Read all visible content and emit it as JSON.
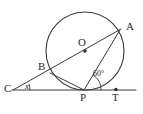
{
  "figure": {
    "type": "circle-geometry-diagram",
    "background_color": "#ffffff",
    "stroke_color": "#3a3a3a",
    "label_color": "#2b2b2b",
    "circle": {
      "center_label": "O",
      "center_x": 85,
      "center_y": 51,
      "radius": 39
    },
    "points": [
      {
        "id": "A",
        "label": "A",
        "x": 120,
        "y": 30,
        "label_x": 126,
        "label_y": 21,
        "on_circle": true,
        "has_dot": false
      },
      {
        "id": "B",
        "label": "B",
        "x": 50,
        "y": 73,
        "label_x": 38,
        "label_y": 61,
        "on_circle": true,
        "has_dot": false
      },
      {
        "id": "C",
        "label": "C",
        "x": 13,
        "y": 90,
        "label_x": 4,
        "label_y": 83,
        "on_circle": false,
        "has_dot": false
      },
      {
        "id": "O",
        "label": "O",
        "x": 85,
        "y": 51,
        "label_x": 78,
        "label_y": 37,
        "on_circle": false,
        "has_dot": true
      },
      {
        "id": "P",
        "label": "P",
        "x": 84,
        "y": 90,
        "label_x": 80,
        "label_y": 92,
        "on_circle": true,
        "has_dot": false
      },
      {
        "id": "T",
        "label": "T",
        "x": 116,
        "y": 90,
        "label_x": 112,
        "label_y": 92,
        "on_circle": false,
        "has_dot": true
      }
    ],
    "segments": [
      {
        "name": "line-C-through-B-O-A",
        "from": "C",
        "to": "A"
      },
      {
        "name": "chord-B-P",
        "from": "B",
        "to": "P"
      },
      {
        "name": "chord-P-A",
        "from": "P",
        "to": "A"
      },
      {
        "name": "tangent-line-C-P-T",
        "from": "C",
        "to": "T"
      }
    ],
    "angles": [
      {
        "name": "angle-at-C",
        "label": "x",
        "vertex": "C",
        "style": "italic",
        "label_x": 25,
        "label_y": 82
      },
      {
        "name": "angle-APT",
        "label": "60°",
        "vertex": "P",
        "style": "small",
        "label_x": 93,
        "label_y": 70
      }
    ]
  }
}
